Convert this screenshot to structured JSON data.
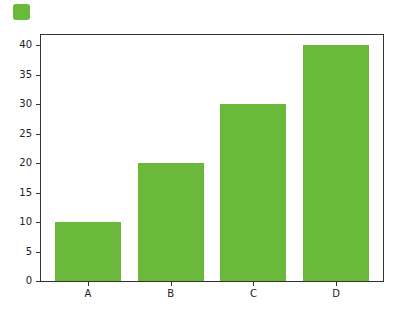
{
  "chart_data": {
    "type": "bar",
    "title": "",
    "xlabel": "",
    "ylabel": "",
    "categories": [
      "A",
      "B",
      "C",
      "D"
    ],
    "values": [
      10,
      20,
      30,
      40
    ],
    "ylim": [
      0,
      42
    ],
    "yticks": [
      0,
      5,
      10,
      15,
      20,
      25,
      30,
      35,
      40
    ],
    "yticklabels": [
      "0",
      "5",
      "10",
      "15",
      "20",
      "25",
      "30",
      "35",
      "40"
    ],
    "grid": false,
    "legend": {
      "position": "top-left",
      "entries": [
        {
          "label": "",
          "color": "#6ab93b"
        }
      ]
    },
    "bar_color": "#6ab93b"
  }
}
